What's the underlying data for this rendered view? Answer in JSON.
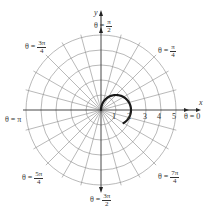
{
  "chart_data": {
    "type": "polar",
    "title": "",
    "center_px": [
      101,
      110
    ],
    "px_per_unit": 15,
    "rings": [
      1,
      2,
      3,
      4,
      5
    ],
    "spoke_step_deg": 15,
    "grid_color": "#8a8a8a",
    "curve_color": "#1a1a1a",
    "curve": {
      "description": "closed-ish arc starting at origin, r ≈ 2cos(θ)",
      "theta_start_deg": 90,
      "theta_end_deg": -30,
      "equation": "r = 2cos(θ)"
    },
    "radial_ticks": [
      "1",
      "2",
      "3",
      "4",
      "5"
    ],
    "x_axis_label": "x",
    "y_axis_label": "y",
    "angle_labels": [
      {
        "id": "pi_over_2",
        "prefix": "θ = ",
        "num": "π",
        "den": "2"
      },
      {
        "id": "pi_over_4",
        "prefix": "θ = ",
        "num": "π",
        "den": "4"
      },
      {
        "id": "three_pi_over_4",
        "prefix": "θ = ",
        "num": "3π",
        "den": "4"
      },
      {
        "id": "pi",
        "text": "θ = π"
      },
      {
        "id": "zero",
        "text": "θ = 0"
      },
      {
        "id": "five_pi_over_4",
        "prefix": "θ = ",
        "num": "5π",
        "den": "4"
      },
      {
        "id": "three_pi_over_2",
        "prefix": "θ = ",
        "num": "3π",
        "den": "2"
      },
      {
        "id": "seven_pi_over_4",
        "prefix": "θ = ",
        "num": "7π",
        "den": "4"
      }
    ]
  }
}
